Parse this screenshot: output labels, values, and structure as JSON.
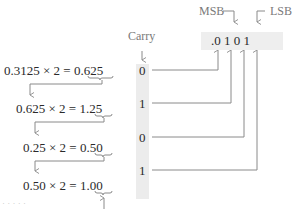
{
  "diagram": {
    "labels": {
      "msb": "MSB",
      "lsb": "LSB",
      "carry": "Carry",
      "carry_arrow": "↓"
    },
    "steps": [
      {
        "expression": "0.3125 × 2 = ",
        "int_part": "0",
        "frac_part": ".625",
        "carry": "0"
      },
      {
        "expression": "0.625 × 2 = ",
        "int_part": "1",
        "frac_part": ".25",
        "carry": "1"
      },
      {
        "expression": "0.25 × 2 = ",
        "int_part": "0",
        "frac_part": ".50",
        "carry": "0"
      },
      {
        "expression": "0.50 × 2 = ",
        "int_part": "1",
        "frac_part": ".00",
        "carry": "1"
      }
    ],
    "result": {
      "point": ".",
      "bits": [
        "0",
        "1",
        "0",
        "1"
      ],
      "text": ".0 1 0 1"
    },
    "footer_faint": "· · · · ·",
    "colors": {
      "line": "#8a8a8a",
      "carry_bg": "#ececec",
      "label": "#7a7a7a",
      "text": "#2a2a2a"
    }
  }
}
